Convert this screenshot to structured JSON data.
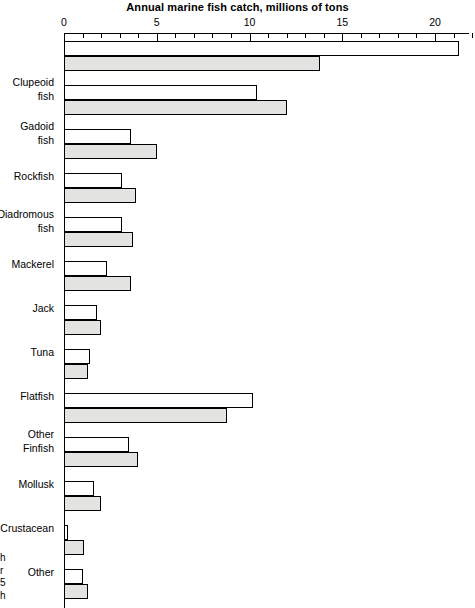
{
  "chart_data": {
    "type": "bar",
    "orientation": "horizontal",
    "title": "Annual marine fish catch, millions of tons",
    "xlabel": "",
    "ylabel": "",
    "xlim": [
      0,
      22.2
    ],
    "xticks": [
      0,
      5,
      10,
      15,
      20
    ],
    "xtick_labels": [
      "0",
      "5",
      "10",
      "15",
      "20"
    ],
    "minor_tick_step": 1,
    "grid": false,
    "legend": "",
    "axis_position": "top",
    "categories": [
      "Clupeoid\nfish",
      "Gadoid\nfish",
      "Rockfish",
      "Diadromous\nfish",
      "Mackerel",
      "Jack",
      "Tuna",
      "Flatfish",
      "Other\nFinfish",
      "Mollusk",
      "Crustacean",
      "Other",
      "Plants"
    ],
    "series": [
      {
        "name": "upper-bar",
        "style": "white",
        "values": [
          21.3,
          10.4,
          3.6,
          3.1,
          3.1,
          2.3,
          1.8,
          1.4,
          10.2,
          3.5,
          1.6,
          0.2,
          1.0
        ]
      },
      {
        "name": "lower-bar",
        "style": "shaded",
        "values": [
          13.8,
          12.0,
          5.0,
          3.9,
          3.7,
          3.6,
          2.0,
          1.3,
          8.8,
          4.0,
          2.0,
          1.1,
          1.3
        ]
      }
    ]
  },
  "clipped_note": "h\nr\n5\nh",
  "colors": {
    "shaded_bar": "#e3e3e1",
    "light_bar": "#ffffff",
    "line": "#000000",
    "background": "#ffffff"
  }
}
